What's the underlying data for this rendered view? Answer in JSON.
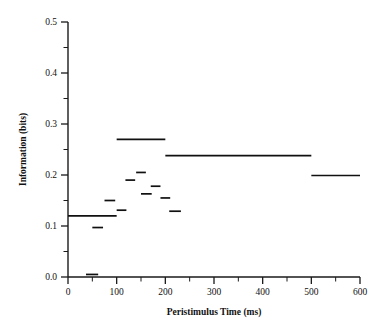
{
  "chart_data": {
    "type": "line",
    "style": "step-segments",
    "title": "",
    "xlabel": "Peristimulus Time (ms)",
    "ylabel": "Information (bits)",
    "xlim": [
      0,
      600
    ],
    "ylim": [
      0.0,
      0.5
    ],
    "grid": false,
    "legend": null,
    "x_ticks_major": [
      0,
      100,
      200,
      300,
      400,
      500,
      600
    ],
    "x_tick_labels": [
      "0",
      "100",
      "200",
      "300",
      "400",
      "500",
      "600"
    ],
    "x_ticks_minor": [
      50,
      150,
      250,
      350,
      450,
      550
    ],
    "y_ticks_major": [
      0.0,
      0.1,
      0.2,
      0.3,
      0.4,
      0.5
    ],
    "y_tick_labels": [
      "0.0",
      "0.1",
      "0.2",
      "0.3",
      "0.4",
      "0.5"
    ],
    "y_ticks_minor": [
      0.05,
      0.15,
      0.25,
      0.35,
      0.45
    ],
    "series": [
      {
        "name": "Information",
        "segments": [
          {
            "x0": 0,
            "x1": 100,
            "y": 0.12
          },
          {
            "x0": 37,
            "x1": 62,
            "y": 0.005
          },
          {
            "x0": 50,
            "x1": 72,
            "y": 0.097
          },
          {
            "x0": 75,
            "x1": 97,
            "y": 0.15
          },
          {
            "x0": 100,
            "x1": 120,
            "y": 0.131
          },
          {
            "x0": 100,
            "x1": 200,
            "y": 0.27
          },
          {
            "x0": 118,
            "x1": 138,
            "y": 0.19
          },
          {
            "x0": 140,
            "x1": 160,
            "y": 0.205
          },
          {
            "x0": 150,
            "x1": 172,
            "y": 0.163
          },
          {
            "x0": 170,
            "x1": 190,
            "y": 0.178
          },
          {
            "x0": 190,
            "x1": 210,
            "y": 0.155
          },
          {
            "x0": 208,
            "x1": 232,
            "y": 0.129
          },
          {
            "x0": 200,
            "x1": 500,
            "y": 0.238
          },
          {
            "x0": 500,
            "x1": 600,
            "y": 0.199
          }
        ]
      }
    ]
  }
}
